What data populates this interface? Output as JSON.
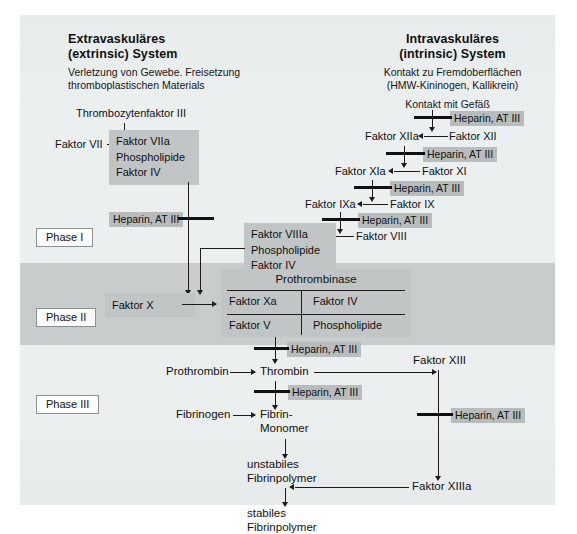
{
  "diagram": {
    "title_left": "Extravaskuläres\n(extrinsic) System",
    "title_right": "Intravaskuläres\n(intrinsic) System",
    "left_header_line1": "Extravaskuläres",
    "left_header_line2": "(extrinsic) System",
    "left_sub_line1": "Verletzung von Gewebe. Freisetzung",
    "left_sub_line2": "thromboplastischen Materials",
    "right_header_line1": "Intravaskuläres",
    "right_header_line2": "(intrinsic) System",
    "right_sub_line1": "Kontakt zu Fremdoberflächen",
    "right_sub_line2": "(HMW-Kininogen, Kallikrein)",
    "right_sub_line3": "Kontakt mit Gefäß"
  },
  "phases": {
    "phase1": "Phase I",
    "phase2": "Phase II",
    "phase3": "Phase III"
  },
  "inhibitor_label": "Heparin, AT III",
  "extrinsic": {
    "thrombozytenfaktor": "Thrombozytenfaktor III",
    "faktor_vii": "Faktor VII",
    "tenase_line1": "Faktor VIIa",
    "tenase_line2": "Phospholipide",
    "tenase_line3": "Faktor IV",
    "heparin_block": "Heparin, AT III"
  },
  "intrinsic": {
    "faktor_xii": "Faktor XII",
    "faktor_xiia": "Faktor XIIa",
    "faktor_xi": "Faktor XI",
    "faktor_xia": "Faktor XIa",
    "faktor_ix": "Faktor IX",
    "faktor_ixa": "Faktor IXa",
    "faktor_viii": "Faktor VIII",
    "heparin_1": "Heparin, AT III",
    "heparin_2": "Heparin, AT III",
    "heparin_3": "Heparin, AT III",
    "heparin_4": "Heparin, AT III",
    "tenase_line1": "Faktor VIIIa",
    "tenase_line2": "Phospholipide",
    "tenase_line3": "Faktor IV"
  },
  "phase2": {
    "faktor_x": "Faktor X",
    "prothrombinase_title": "Prothrombinase",
    "cell_r1c1": "Faktor Xa",
    "cell_r1c2": "Faktor IV",
    "cell_r2c1": "Faktor V",
    "cell_r2c2": "Phospholipide",
    "heparin": "Heparin, AT III"
  },
  "phase3": {
    "prothrombin": "Prothrombin",
    "thrombin": "Thrombin",
    "fibrinogen": "Fibrinogen",
    "fibrin_monomer_line1": "Fibrin-",
    "fibrin_monomer_line2": "Monomer",
    "unstable_line1": "unstabiles",
    "unstable_line2": "Fibrinpolymer",
    "stable_line1": "stabiles",
    "stable_line2": "Fibrinpolymer",
    "faktor_xiii": "Faktor XIII",
    "faktor_xiiia": "Faktor XIIIa",
    "heparin_thrombin": "Heparin, AT III",
    "heparin_xiii": "Heparin, AT III"
  },
  "colors": {
    "paper": "#eceff0",
    "band": "#c9cccd",
    "chip": "#b9bcbd",
    "block": "#c2c5c6",
    "ink": "#1c1c1c"
  }
}
